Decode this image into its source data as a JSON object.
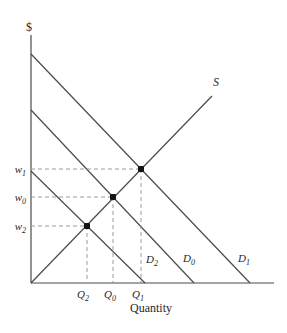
{
  "figure": {
    "width": 287,
    "height": 333,
    "background": "#ffffff",
    "line_color": "#4a4a4a",
    "dash_color": "#9a9a9a",
    "dot_color": "#141414",
    "text_color": "#1f1f1f",
    "axes": {
      "y_axis": {
        "x1": 31,
        "y1": 35,
        "x2": 31,
        "y2": 283
      },
      "x_axis": {
        "x1": 31,
        "y1": 283,
        "x2": 274,
        "y2": 283
      }
    },
    "curves": [
      {
        "name": "supply-curve",
        "id": "S",
        "x1": 31,
        "y1": 283,
        "x2": 212,
        "y2": 96
      },
      {
        "name": "demand-curve-d1",
        "id": "D1",
        "x1": 31,
        "y1": 54,
        "x2": 250,
        "y2": 283
      },
      {
        "name": "demand-curve-d0",
        "id": "D0",
        "x1": 31,
        "y1": 110,
        "x2": 194,
        "y2": 283
      },
      {
        "name": "demand-curve-d2",
        "id": "D2",
        "x1": 31,
        "y1": 171,
        "x2": 145,
        "y2": 283
      }
    ],
    "guides": [
      {
        "name": "w1-price-guide",
        "x1": 31,
        "y1": 169,
        "x2": 141,
        "y2": 169
      },
      {
        "name": "w0-price-guide",
        "x1": 31,
        "y1": 197,
        "x2": 113,
        "y2": 197
      },
      {
        "name": "w2-price-guide",
        "x1": 31,
        "y1": 226,
        "x2": 87,
        "y2": 226
      },
      {
        "name": "q1-quantity-guide",
        "x1": 141,
        "y1": 169,
        "x2": 141,
        "y2": 283
      },
      {
        "name": "q0-quantity-guide",
        "x1": 113,
        "y1": 197,
        "x2": 113,
        "y2": 283
      },
      {
        "name": "q2-quantity-guide",
        "x1": 87,
        "y1": 226,
        "x2": 87,
        "y2": 283
      }
    ],
    "equilibrium_points": [
      {
        "name": "equilibrium-point-e1",
        "x": 141,
        "y": 169
      },
      {
        "name": "equilibrium-point-e0",
        "x": 113,
        "y": 197
      },
      {
        "name": "equilibrium-point-e2",
        "x": 87,
        "y": 226
      }
    ],
    "labels": [
      {
        "name": "y-axis-label",
        "text": "$",
        "sub": "",
        "x": 29,
        "y": 31,
        "anchor": "middle",
        "italic": false,
        "size": 12
      },
      {
        "name": "x-axis-label",
        "text": "Quantity",
        "sub": "",
        "x": 151,
        "y": 312,
        "anchor": "middle",
        "italic": false,
        "size": 12
      },
      {
        "name": "supply-curve-label",
        "text": "S",
        "sub": "",
        "x": 213,
        "y": 86,
        "anchor": "start",
        "italic": true,
        "size": 12
      },
      {
        "name": "price-w1-label",
        "text": "w",
        "sub": "1",
        "x": 26,
        "y": 173,
        "anchor": "end",
        "italic": true,
        "size": 11
      },
      {
        "name": "price-w0-label",
        "text": "w",
        "sub": "0",
        "x": 26,
        "y": 201,
        "anchor": "end",
        "italic": true,
        "size": 11
      },
      {
        "name": "price-w2-label",
        "text": "w",
        "sub": "2",
        "x": 26,
        "y": 230,
        "anchor": "end",
        "italic": true,
        "size": 11
      },
      {
        "name": "quantity-q2-label",
        "text": "Q",
        "sub": "2",
        "x": 83,
        "y": 298,
        "anchor": "middle",
        "italic": true,
        "size": 11
      },
      {
        "name": "quantity-q0-label",
        "text": "Q",
        "sub": "0",
        "x": 110,
        "y": 298,
        "anchor": "middle",
        "italic": true,
        "size": 11
      },
      {
        "name": "quantity-q1-label",
        "text": "Q",
        "sub": "1",
        "x": 138,
        "y": 298,
        "anchor": "middle",
        "italic": true,
        "size": 11
      },
      {
        "name": "demand-d2-label",
        "text": "D",
        "sub": "2",
        "x": 146,
        "y": 263,
        "anchor": "start",
        "italic": true,
        "size": 11
      },
      {
        "name": "demand-d0-label",
        "text": "D",
        "sub": "0",
        "x": 183,
        "y": 262,
        "anchor": "start",
        "italic": true,
        "size": 11
      },
      {
        "name": "demand-d1-label",
        "text": "D",
        "sub": "1",
        "x": 238,
        "y": 262,
        "anchor": "start",
        "italic": true,
        "size": 11
      }
    ]
  },
  "chart_data": {
    "type": "line",
    "title": "",
    "xlabel": "Quantity",
    "ylabel": "$",
    "grid": false,
    "series": [
      {
        "name": "S",
        "role": "supply",
        "points_px": [
          [
            31,
            283
          ],
          [
            212,
            96
          ]
        ]
      },
      {
        "name": "D1",
        "role": "demand",
        "points_px": [
          [
            31,
            54
          ],
          [
            250,
            283
          ]
        ]
      },
      {
        "name": "D0",
        "role": "demand",
        "points_px": [
          [
            31,
            110
          ],
          [
            194,
            283
          ]
        ]
      },
      {
        "name": "D2",
        "role": "demand",
        "points_px": [
          [
            31,
            171
          ],
          [
            145,
            283
          ]
        ]
      }
    ],
    "equilibria": [
      {
        "price_label": "w1",
        "quantity_label": "Q1",
        "curves": [
          "S",
          "D1"
        ]
      },
      {
        "price_label": "w0",
        "quantity_label": "Q0",
        "curves": [
          "S",
          "D0"
        ]
      },
      {
        "price_label": "w2",
        "quantity_label": "Q2",
        "curves": [
          "S",
          "D2"
        ]
      }
    ],
    "annotations": [
      "$",
      "S",
      "D2",
      "D0",
      "D1",
      "w1",
      "w0",
      "w2",
      "Q2",
      "Q0",
      "Q1",
      "Quantity"
    ]
  }
}
